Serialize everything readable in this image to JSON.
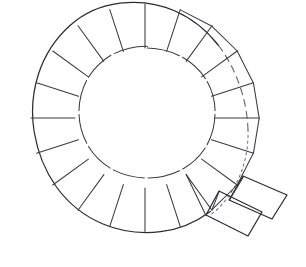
{
  "figure": {
    "medium": "hand-drawn line drawing",
    "background_color": "#ffffff",
    "ink_color": "#2b2b33",
    "dashed_ink_color": "#5b5b66",
    "canvas": {
      "width": 306,
      "height": 267
    }
  },
  "chart_data": {
    "type": "diagram",
    "geometry": {
      "center": {
        "x": 145,
        "y": 118
      },
      "outer_radius": 114,
      "inner_radius": 70,
      "ring_thickness": 44,
      "segment_count": 20,
      "segment_angle_deg": 18
    },
    "outer_boundary": [
      {
        "name": "solid-outer-arc",
        "style": "solid",
        "start_angle_deg": 55,
        "end_angle_deg": 285,
        "sweep_deg": 230,
        "note": "left / lower portion drawn as a firm continuous line"
      },
      {
        "name": "dashed-outer-arc",
        "style": "dashed",
        "start_angle_deg": 285,
        "end_angle_deg": 340,
        "sweep_deg": 55,
        "note": "upper right portion drawn with long dashes"
      },
      {
        "name": "dotted-outer-arc",
        "style": "dotted",
        "start_angle_deg": 340,
        "end_angle_deg": 55,
        "sweep_deg": 75,
        "note": "right portion drawn with fine dots"
      }
    ],
    "inner_boundary": {
      "name": "inner-circle",
      "style": "solid-with-gaps",
      "radius": 70,
      "note": "hand-drawn circle broken by small gaps at each radial divider"
    },
    "radial_dividers": {
      "count": 20,
      "spacing_deg": 18,
      "style": "solid",
      "note": "straight lines from inner circle to outer arc separating each voussoir-like block"
    },
    "detached_blocks": [
      {
        "name": "detached-block-upper",
        "shape": "quadrilateral",
        "points": [
          [
            243,
            176
          ],
          [
            287,
            195
          ],
          [
            272,
            219
          ],
          [
            229,
            200
          ]
        ],
        "note": "block displaced tangentially outward at lower right"
      },
      {
        "name": "detached-block-lower",
        "shape": "quadrilateral",
        "points": [
          [
            219,
            191
          ],
          [
            262,
            212
          ],
          [
            248,
            236
          ],
          [
            206,
            215
          ]
        ],
        "note": "second displaced block, overlapping the first"
      }
    ],
    "annotations": [],
    "legend": [],
    "axis_labels": {
      "x": "",
      "y": ""
    }
  }
}
